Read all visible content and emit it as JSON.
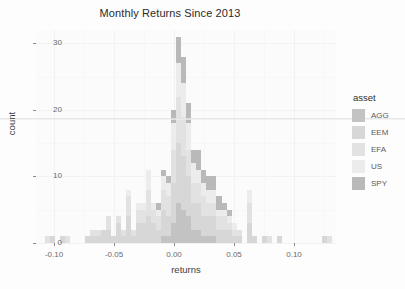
{
  "chart_data": {
    "type": "bar",
    "subtype": "stacked-histogram",
    "title": "Monthly Returns Since 2013",
    "xlabel": "returns",
    "ylabel": "count",
    "xlim": [
      -0.115,
      0.135
    ],
    "ylim": [
      0,
      32
    ],
    "xticks": [
      -0.1,
      -0.05,
      0.0,
      0.05,
      0.1
    ],
    "xticklabels": [
      "-0.10",
      "-0.05",
      "0.00",
      "0.05",
      "0.10"
    ],
    "yticks": [
      0,
      10,
      20,
      30
    ],
    "yticklabels": [
      "0",
      "10",
      "20",
      "30"
    ],
    "grid": true,
    "legend_position": "right",
    "legend_title": "asset",
    "series": [
      {
        "name": "AGG",
        "color": "#c3c3c3"
      },
      {
        "name": "EEM",
        "color": "#d7d7d7"
      },
      {
        "name": "EFA",
        "color": "#e2e2e2"
      },
      {
        "name": "US",
        "color": "#ececec"
      },
      {
        "name": "SPY",
        "color": "#b9b9b9"
      }
    ],
    "binwidth": 0.0042,
    "bins": [
      {
        "x": -0.1095,
        "values": [
          0,
          0,
          0,
          0,
          0
        ]
      },
      {
        "x": -0.1053,
        "values": [
          0,
          0,
          1,
          0,
          0
        ]
      },
      {
        "x": -0.1011,
        "values": [
          0,
          1,
          0,
          0,
          0
        ]
      },
      {
        "x": -0.0969,
        "values": [
          0,
          0,
          0,
          0,
          0
        ]
      },
      {
        "x": -0.0927,
        "values": [
          0,
          1,
          0,
          0,
          0
        ]
      },
      {
        "x": -0.0885,
        "values": [
          0,
          0,
          1,
          0,
          0
        ]
      },
      {
        "x": -0.0843,
        "values": [
          0,
          0,
          0,
          0,
          0
        ]
      },
      {
        "x": -0.0801,
        "values": [
          0,
          0,
          0,
          0,
          0
        ]
      },
      {
        "x": -0.0759,
        "values": [
          0,
          0,
          0,
          0,
          0
        ]
      },
      {
        "x": -0.0717,
        "values": [
          0,
          1,
          0,
          0,
          0
        ]
      },
      {
        "x": -0.0675,
        "values": [
          0,
          1,
          1,
          0,
          0
        ]
      },
      {
        "x": -0.0633,
        "values": [
          0,
          1,
          1,
          0,
          0
        ]
      },
      {
        "x": -0.0591,
        "values": [
          0,
          2,
          0,
          0,
          0
        ]
      },
      {
        "x": -0.0549,
        "values": [
          0,
          2,
          2,
          0,
          0
        ]
      },
      {
        "x": -0.0507,
        "values": [
          0,
          1,
          0,
          0,
          0
        ]
      },
      {
        "x": -0.0465,
        "values": [
          0,
          3,
          1,
          0,
          0
        ]
      },
      {
        "x": -0.0423,
        "values": [
          0,
          1,
          1,
          0,
          0
        ]
      },
      {
        "x": -0.0381,
        "values": [
          0,
          4,
          3,
          1,
          0
        ]
      },
      {
        "x": -0.0339,
        "values": [
          0,
          1,
          1,
          0,
          0
        ]
      },
      {
        "x": -0.0297,
        "values": [
          0,
          3,
          2,
          1,
          0
        ]
      },
      {
        "x": -0.0255,
        "values": [
          0,
          3,
          2,
          1,
          0
        ]
      },
      {
        "x": -0.0213,
        "values": [
          0,
          4,
          4,
          3,
          0
        ]
      },
      {
        "x": -0.0171,
        "values": [
          0,
          3,
          2,
          1,
          0
        ]
      },
      {
        "x": -0.0129,
        "values": [
          0,
          2,
          2,
          1,
          1
        ]
      },
      {
        "x": -0.0087,
        "values": [
          1,
          4,
          3,
          2,
          1
        ]
      },
      {
        "x": -0.0045,
        "values": [
          1,
          3,
          3,
          2,
          1
        ]
      },
      {
        "x": -0.0003,
        "values": [
          3,
          6,
          5,
          4,
          2
        ]
      },
      {
        "x": 0.0039,
        "values": [
          6,
          9,
          7,
          5,
          4
        ]
      },
      {
        "x": 0.0081,
        "values": [
          5,
          8,
          6,
          5,
          4
        ]
      },
      {
        "x": 0.0123,
        "values": [
          4,
          6,
          4,
          4,
          3
        ]
      },
      {
        "x": 0.0165,
        "values": [
          2,
          4,
          3,
          3,
          2
        ]
      },
      {
        "x": 0.0207,
        "values": [
          2,
          4,
          3,
          2,
          3
        ]
      },
      {
        "x": 0.0249,
        "values": [
          1,
          3,
          3,
          2,
          2
        ]
      },
      {
        "x": 0.0291,
        "values": [
          1,
          3,
          2,
          2,
          2
        ]
      },
      {
        "x": 0.0333,
        "values": [
          1,
          3,
          2,
          2,
          2
        ]
      },
      {
        "x": 0.0375,
        "values": [
          0,
          2,
          2,
          1,
          2
        ]
      },
      {
        "x": 0.0417,
        "values": [
          0,
          2,
          2,
          1,
          1
        ]
      },
      {
        "x": 0.0459,
        "values": [
          0,
          2,
          1,
          1,
          1
        ]
      },
      {
        "x": 0.0501,
        "values": [
          0,
          1,
          1,
          1,
          0
        ]
      },
      {
        "x": 0.0543,
        "values": [
          0,
          1,
          1,
          0,
          0
        ]
      },
      {
        "x": 0.0585,
        "values": [
          0,
          0,
          0,
          0,
          0
        ]
      },
      {
        "x": 0.0627,
        "values": [
          0,
          3,
          3,
          2,
          0
        ]
      },
      {
        "x": 0.0669,
        "values": [
          0,
          1,
          0,
          0,
          0
        ]
      },
      {
        "x": 0.0711,
        "values": [
          0,
          0,
          0,
          0,
          0
        ]
      },
      {
        "x": 0.0753,
        "values": [
          0,
          1,
          0,
          0,
          0
        ]
      },
      {
        "x": 0.0795,
        "values": [
          0,
          0,
          1,
          0,
          0
        ]
      },
      {
        "x": 0.0837,
        "values": [
          0,
          0,
          0,
          0,
          0
        ]
      },
      {
        "x": 0.0879,
        "values": [
          0,
          1,
          0,
          0,
          0
        ]
      },
      {
        "x": 0.1005,
        "values": [
          0,
          0,
          0,
          0,
          0
        ]
      },
      {
        "x": 0.1257,
        "values": [
          0,
          1,
          0,
          0,
          0
        ]
      },
      {
        "x": 0.1299,
        "values": [
          0,
          0,
          1,
          0,
          0
        ]
      }
    ]
  },
  "legend": {
    "title": "asset",
    "items": [
      {
        "label": "AGG",
        "color": "#c3c3c3"
      },
      {
        "label": "EEM",
        "color": "#d7d7d7"
      },
      {
        "label": "EFA",
        "color": "#e2e2e2"
      },
      {
        "label": "US",
        "color": "#ececec"
      },
      {
        "label": "SPY",
        "color": "#b9b9b9"
      }
    ]
  },
  "theme": {
    "panel_background": "#fbfbfb",
    "grid_color": "#f2f2f2",
    "text_color": "#4d4d4d",
    "title_color": "#2b2b2b"
  }
}
